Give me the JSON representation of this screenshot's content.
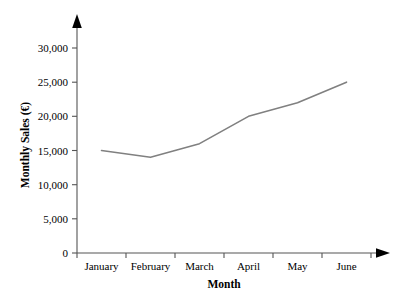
{
  "chart_data": {
    "type": "line",
    "title": "",
    "xlabel": "Month",
    "ylabel": "Monthly Sales (€)",
    "categories": [
      "January",
      "February",
      "March",
      "April",
      "May",
      "June"
    ],
    "values": [
      15000,
      14000,
      16000,
      20000,
      22000,
      25000
    ],
    "series": [
      {
        "name": "Monthly Sales",
        "values": [
          15000,
          14000,
          16000,
          20000,
          22000,
          25000
        ]
      }
    ],
    "ylim": [
      0,
      30000
    ],
    "ytick_values": [
      0,
      5000,
      10000,
      15000,
      20000,
      25000,
      30000
    ],
    "ytick_labels": [
      "0",
      "5,000",
      "10,000",
      "15,000",
      "20,000",
      "25,000",
      "30,000"
    ],
    "grid": false,
    "legend": false,
    "legend_position": "none",
    "line_color": "#808080",
    "axis_color": "#555555",
    "text_color": "#000000",
    "background_color": "#ffffff",
    "y_axis_arrow": true,
    "x_axis_arrow": true
  }
}
